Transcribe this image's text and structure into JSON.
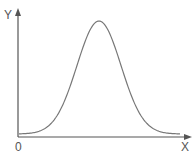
{
  "chart_data": {
    "type": "line",
    "title": "",
    "xlabel": "X",
    "ylabel": "Y",
    "origin_label": "0",
    "series": [
      {
        "name": "bell-curve",
        "peak_x_fraction": 0.5,
        "shape": "gaussian"
      }
    ],
    "grid": false,
    "legend": null
  },
  "labels": {
    "y_axis": "Y",
    "x_axis": "X",
    "origin": "0"
  },
  "colors": {
    "axis": "#555555",
    "curve": "#777777"
  }
}
